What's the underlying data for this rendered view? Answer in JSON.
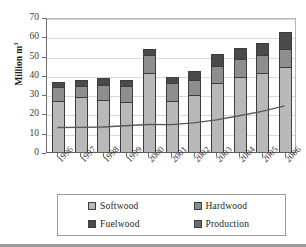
{
  "chart_data": {
    "type": "bar",
    "stacked": true,
    "title": "",
    "xlabel": "",
    "ylabel": "Million m³",
    "ylim": [
      0,
      70
    ],
    "yticks": [
      0,
      10,
      20,
      30,
      40,
      50,
      60,
      70
    ],
    "grid": true,
    "legend_position": "bottom",
    "categories": [
      "1996",
      "1997",
      "1998",
      "1999",
      "2000",
      "2001",
      "2002",
      "2003",
      "2004",
      "2005",
      "2006"
    ],
    "series": [
      {
        "name": "Softwood",
        "type": "bar",
        "color": "#b9b9b9",
        "values": [
          26.8,
          29.3,
          27.5,
          26.2,
          41.5,
          27.0,
          29.9,
          36.1,
          39.4,
          41.7,
          44.8
        ]
      },
      {
        "name": "Hardwood",
        "type": "bar",
        "color": "#8e8e8e",
        "values": [
          7.5,
          5.6,
          8.0,
          8.4,
          9.5,
          9.5,
          8.2,
          9.2,
          9.2,
          9.0,
          8.9
        ]
      },
      {
        "name": "Fuelwood",
        "type": "bar",
        "color": "#4a4a4a",
        "values": [
          2.7,
          3.2,
          3.4,
          3.2,
          2.8,
          3.1,
          4.2,
          5.8,
          5.9,
          6.3,
          8.8
        ]
      },
      {
        "name": "Production",
        "type": "line",
        "color": "#595959",
        "values": [
          13.2,
          13.3,
          13.5,
          14.1,
          14.8,
          14.7,
          15.6,
          17.2,
          19.3,
          21.6,
          24.4
        ]
      }
    ],
    "totals": [
      37.0,
      38.1,
      38.9,
      37.8,
      53.8,
      39.6,
      42.3,
      51.1,
      54.5,
      57.0,
      62.5
    ]
  },
  "legend": {
    "items": [
      {
        "label": "Softwood",
        "color": "#b9b9b9",
        "swatch": "legend-swatch-softwood"
      },
      {
        "label": "Hardwood",
        "color": "#8e8e8e",
        "swatch": "legend-swatch-hardwood"
      },
      {
        "label": "Fuelwood",
        "color": "#4a4a4a",
        "swatch": "legend-swatch-fuelwood"
      },
      {
        "label": "Production",
        "color": "#6b6b6b",
        "swatch": "legend-swatch-production"
      }
    ]
  },
  "axis": {
    "y_title_main": "Million m",
    "y_title_sup": "3",
    "y_tick_labels": [
      "70",
      "60",
      "50",
      "40",
      "30",
      "20",
      "10",
      "0"
    ]
  }
}
